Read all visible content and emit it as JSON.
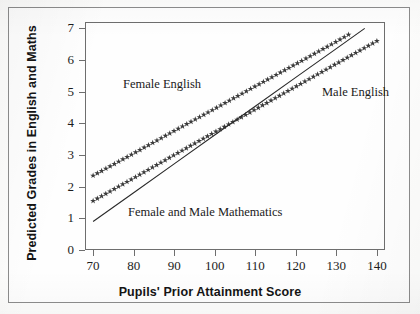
{
  "figure": {
    "x_axis_title": "Pupils' Prior Attainment Score",
    "y_axis_title": "Predicted Grades in English and Maths",
    "annotations": {
      "female_english": "Female English",
      "male_english": "Male English",
      "mathematics": "Female and Male Mathematics"
    }
  },
  "chart_data": {
    "type": "line",
    "title": "",
    "xlabel": "Pupils' Prior Attainment Score",
    "ylabel": "Predicted Grades in English and Maths",
    "xlim": [
      68,
      142
    ],
    "ylim": [
      0,
      7.2
    ],
    "xticks": [
      70,
      80,
      90,
      100,
      110,
      120,
      130,
      140
    ],
    "yticks": [
      0,
      1,
      2,
      3,
      4,
      5,
      6,
      7
    ],
    "xtick_labels": [
      "70",
      "80",
      "90",
      "100",
      "110",
      "120",
      "130",
      "140"
    ],
    "ytick_labels": [
      "0",
      "1",
      "2",
      "3",
      "4",
      "5",
      "6",
      "7"
    ],
    "grid": false,
    "legend": "inline-annotations",
    "series": [
      {
        "name": "Female English",
        "marker": "star",
        "style": "marker-line",
        "color": "#2a2a2a",
        "x": [
          70,
          80,
          90,
          100,
          110,
          120,
          130,
          133
        ],
        "y": [
          2.35,
          3.05,
          3.76,
          4.46,
          5.17,
          5.87,
          6.58,
          6.8
        ]
      },
      {
        "name": "Male English",
        "marker": "star",
        "style": "marker-line",
        "color": "#2a2a2a",
        "x": [
          70,
          80,
          90,
          100,
          110,
          120,
          130,
          140
        ],
        "y": [
          1.55,
          2.27,
          3.0,
          3.72,
          4.44,
          5.16,
          5.88,
          6.6
        ]
      },
      {
        "name": "Female and Male Mathematics",
        "marker": "none",
        "style": "solid-line",
        "color": "#2a2a2a",
        "x": [
          70,
          80,
          90,
          100,
          110,
          120,
          130,
          137
        ],
        "y": [
          0.9,
          1.81,
          2.72,
          3.63,
          4.54,
          5.45,
          6.36,
          7.0
        ]
      }
    ]
  }
}
